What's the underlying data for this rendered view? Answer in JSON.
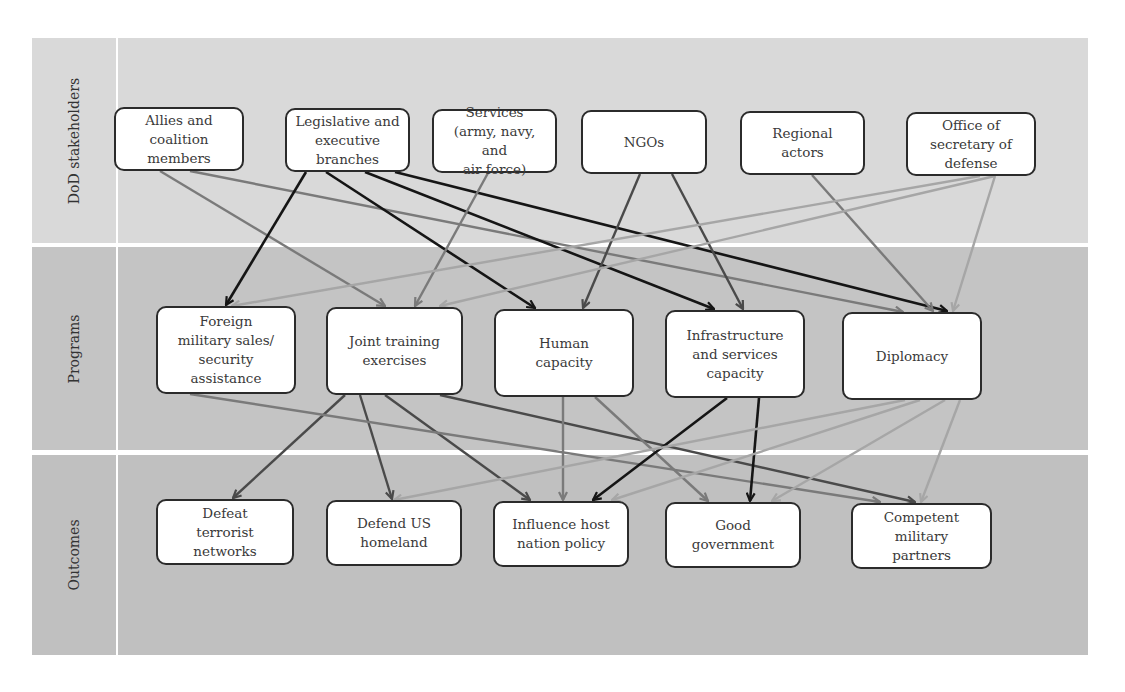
{
  "colors": {
    "band_stakeholders": "#d9d9d9",
    "band_programs": "#c4c4c4",
    "band_outcomes": "#c0c0c0",
    "edge_black": "#151515",
    "edge_dark": "#4a4a4a",
    "edge_mid": "#7a7a7a",
    "edge_light": "#a6a6a6"
  },
  "bands": [
    {
      "id": "stakeholders",
      "label": "DoD stakeholders",
      "top": 38,
      "height": 205
    },
    {
      "id": "programs",
      "label": "Programs",
      "top": 247,
      "height": 203
    },
    {
      "id": "outcomes",
      "label": "Outcomes",
      "top": 455,
      "height": 200
    }
  ],
  "nodes": {
    "allies": {
      "label": "Allies and\ncoalition\nmembers",
      "x": 114,
      "y": 107,
      "w": 130,
      "h": 64
    },
    "legislative": {
      "label": "Legislative and\nexecutive\nbranches",
      "x": 285,
      "y": 108,
      "w": 125,
      "h": 64
    },
    "services": {
      "label": "Services\n(army, navy, and\nair force)",
      "x": 432,
      "y": 109,
      "w": 125,
      "h": 64
    },
    "ngos": {
      "label": "NGOs",
      "x": 581,
      "y": 110,
      "w": 126,
      "h": 64
    },
    "regional": {
      "label": "Regional\nactors",
      "x": 740,
      "y": 111,
      "w": 125,
      "h": 64
    },
    "osd": {
      "label": "Office of\nsecretary of\ndefense",
      "x": 906,
      "y": 112,
      "w": 130,
      "h": 64
    },
    "foreign": {
      "label": "Foreign\nmilitary sales/\nsecurity\nassistance",
      "x": 156,
      "y": 306,
      "w": 140,
      "h": 88
    },
    "joint": {
      "label": "Joint training\nexercises",
      "x": 326,
      "y": 307,
      "w": 137,
      "h": 88
    },
    "human": {
      "label": "Human\ncapacity",
      "x": 494,
      "y": 309,
      "w": 140,
      "h": 88
    },
    "infra": {
      "label": "Infrastructure\nand services\ncapacity",
      "x": 665,
      "y": 310,
      "w": 140,
      "h": 88
    },
    "diplomacy": {
      "label": "Diplomacy",
      "x": 842,
      "y": 312,
      "w": 140,
      "h": 88
    },
    "defeat": {
      "label": "Defeat\nterrorist\nnetworks",
      "x": 156,
      "y": 499,
      "w": 138,
      "h": 66
    },
    "defend": {
      "label": "Defend US\nhomeland",
      "x": 326,
      "y": 500,
      "w": 136,
      "h": 66
    },
    "influence": {
      "label": "Influence host\nnation policy",
      "x": 493,
      "y": 501,
      "w": 136,
      "h": 66
    },
    "good": {
      "label": "Good\ngovernment",
      "x": 665,
      "y": 502,
      "w": 136,
      "h": 66
    },
    "competent": {
      "label": "Competent\nmilitary\npartners",
      "x": 851,
      "y": 503,
      "w": 141,
      "h": 66
    }
  },
  "edges": [
    {
      "from": "allies",
      "to": "joint",
      "shade": "mid",
      "x1": 160,
      "y1": 171,
      "x2": 385,
      "y2": 306
    },
    {
      "from": "allies",
      "to": "diplomacy",
      "shade": "mid",
      "x1": 190,
      "y1": 171,
      "x2": 903,
      "y2": 312
    },
    {
      "from": "legislative",
      "to": "foreign",
      "shade": "black",
      "x1": 306,
      "y1": 172,
      "x2": 226,
      "y2": 305
    },
    {
      "from": "legislative",
      "to": "human",
      "shade": "black",
      "x1": 326,
      "y1": 172,
      "x2": 535,
      "y2": 308
    },
    {
      "from": "legislative",
      "to": "infra",
      "shade": "black",
      "x1": 365,
      "y1": 172,
      "x2": 714,
      "y2": 309
    },
    {
      "from": "legislative",
      "to": "diplomacy",
      "shade": "black",
      "x1": 395,
      "y1": 172,
      "x2": 947,
      "y2": 311
    },
    {
      "from": "services",
      "to": "joint",
      "shade": "mid",
      "x1": 488,
      "y1": 173,
      "x2": 415,
      "y2": 306
    },
    {
      "from": "ngos",
      "to": "human",
      "shade": "dark",
      "x1": 640,
      "y1": 174,
      "x2": 583,
      "y2": 308
    },
    {
      "from": "ngos",
      "to": "infra",
      "shade": "dark",
      "x1": 672,
      "y1": 174,
      "x2": 743,
      "y2": 309
    },
    {
      "from": "regional",
      "to": "diplomacy",
      "shade": "mid",
      "x1": 812,
      "y1": 175,
      "x2": 933,
      "y2": 311
    },
    {
      "from": "osd",
      "to": "foreign",
      "shade": "light",
      "x1": 980,
      "y1": 176,
      "x2": 232,
      "y2": 306
    },
    {
      "from": "osd",
      "to": "joint",
      "shade": "light",
      "x1": 995,
      "y1": 176,
      "x2": 440,
      "y2": 306
    },
    {
      "from": "osd",
      "to": "diplomacy",
      "shade": "light",
      "x1": 995,
      "y1": 176,
      "x2": 953,
      "y2": 311
    },
    {
      "from": "joint",
      "to": "defeat",
      "shade": "dark",
      "x1": 345,
      "y1": 395,
      "x2": 233,
      "y2": 498
    },
    {
      "from": "joint",
      "to": "defend",
      "shade": "dark",
      "x1": 360,
      "y1": 395,
      "x2": 392,
      "y2": 499
    },
    {
      "from": "joint",
      "to": "influence",
      "shade": "dark",
      "x1": 385,
      "y1": 395,
      "x2": 530,
      "y2": 500
    },
    {
      "from": "joint",
      "to": "competent",
      "shade": "dark",
      "x1": 440,
      "y1": 395,
      "x2": 915,
      "y2": 502
    },
    {
      "from": "foreign",
      "to": "competent",
      "shade": "mid",
      "x1": 190,
      "y1": 394,
      "x2": 880,
      "y2": 502
    },
    {
      "from": "human",
      "to": "influence",
      "shade": "mid",
      "x1": 563,
      "y1": 397,
      "x2": 563,
      "y2": 500
    },
    {
      "from": "human",
      "to": "good",
      "shade": "mid",
      "x1": 595,
      "y1": 397,
      "x2": 708,
      "y2": 501
    },
    {
      "from": "infra",
      "to": "influence",
      "shade": "black",
      "x1": 727,
      "y1": 398,
      "x2": 593,
      "y2": 500
    },
    {
      "from": "infra",
      "to": "good",
      "shade": "black",
      "x1": 759,
      "y1": 398,
      "x2": 750,
      "y2": 501
    },
    {
      "from": "diplomacy",
      "to": "defend",
      "shade": "light",
      "x1": 905,
      "y1": 400,
      "x2": 394,
      "y2": 500
    },
    {
      "from": "diplomacy",
      "to": "influence",
      "shade": "light",
      "x1": 920,
      "y1": 400,
      "x2": 612,
      "y2": 500
    },
    {
      "from": "diplomacy",
      "to": "good",
      "shade": "light",
      "x1": 945,
      "y1": 400,
      "x2": 772,
      "y2": 501
    },
    {
      "from": "diplomacy",
      "to": "competent",
      "shade": "light",
      "x1": 960,
      "y1": 400,
      "x2": 921,
      "y2": 502
    }
  ]
}
